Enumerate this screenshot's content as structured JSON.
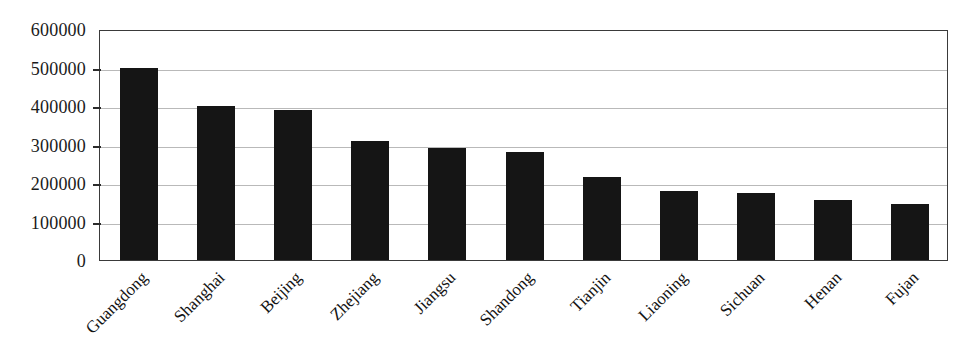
{
  "chart_data": {
    "type": "bar",
    "title": "",
    "subtitle": "",
    "xlabel": "",
    "ylabel": "",
    "categories": [
      "Guangdong",
      "Shanghai",
      "Beijing",
      "Zhejiang",
      "Jiangsu",
      "Shandong",
      "Tianjin",
      "Liaoning",
      "Sichuan",
      "Henan",
      "Fujan"
    ],
    "values": [
      500000,
      400000,
      390000,
      310000,
      290000,
      280000,
      215000,
      178000,
      175000,
      155000,
      145000
    ],
    "ylim": [
      0,
      600000
    ],
    "ytick_labels": [
      "600000",
      "500000",
      "400000",
      "300000",
      "200000",
      "100000",
      "0"
    ],
    "ytick_values": [
      600000,
      500000,
      400000,
      300000,
      200000,
      100000,
      0
    ],
    "grid": "horizontal",
    "legend": "none",
    "bar_color": "#151515",
    "gridline_color": "#b9b9b9",
    "axis_color": "#3a3a3a",
    "label_rotation": "-45"
  }
}
